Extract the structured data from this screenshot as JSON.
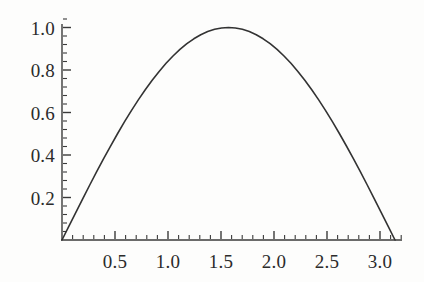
{
  "chart_data": {
    "type": "line",
    "title": "",
    "subtitle": "",
    "xlabel": "",
    "ylabel": "",
    "function": "sin(x)",
    "xlim": [
      0,
      3.2
    ],
    "ylim": [
      0,
      1.05
    ],
    "axis_origin": [
      0,
      0
    ],
    "grid": false,
    "legend": null,
    "legend_position": "none",
    "line_color": "#333333",
    "line_width": 1.6,
    "background_color": "#fdfdfc",
    "axis_color": "#3a3a3a",
    "x_tick_labels": [
      "0.5",
      "1.0",
      "1.5",
      "2.0",
      "2.5",
      "3.0"
    ],
    "x_tick_values": [
      0.5,
      1.0,
      1.5,
      2.0,
      2.5,
      3.0
    ],
    "x_minor_tick_step": 0.1,
    "y_tick_labels": [
      "0.2",
      "0.4",
      "0.6",
      "0.8",
      "1.0"
    ],
    "y_tick_values": [
      0.2,
      0.4,
      0.6,
      0.8,
      1.0
    ],
    "y_minor_tick_step": 0.04,
    "x": [
      0.0,
      0.0654,
      0.1309,
      0.1963,
      0.2618,
      0.3272,
      0.3927,
      0.4581,
      0.5236,
      0.589,
      0.6545,
      0.7199,
      0.7854,
      0.8508,
      0.9163,
      0.9817,
      1.0472,
      1.1126,
      1.1781,
      1.2435,
      1.309,
      1.3744,
      1.4399,
      1.5053,
      1.5708,
      1.6362,
      1.7017,
      1.7671,
      1.8326,
      1.898,
      1.9635,
      2.0289,
      2.0944,
      2.1598,
      2.2253,
      2.2907,
      2.3562,
      2.4216,
      2.4871,
      2.5525,
      2.618,
      2.6834,
      2.7489,
      2.8143,
      2.8798,
      2.9452,
      3.0107,
      3.0761,
      3.1416
    ],
    "y": [
      0.0,
      0.0654,
      0.1305,
      0.1951,
      0.2588,
      0.3214,
      0.3827,
      0.4423,
      0.5,
      0.5556,
      0.6088,
      0.6593,
      0.7071,
      0.7518,
      0.7934,
      0.8315,
      0.866,
      0.8969,
      0.9239,
      0.9469,
      0.9659,
      0.9808,
      0.9914,
      0.9979,
      1.0,
      0.9979,
      0.9914,
      0.9808,
      0.9659,
      0.9469,
      0.9239,
      0.8969,
      0.866,
      0.8315,
      0.7934,
      0.7518,
      0.7071,
      0.6593,
      0.6088,
      0.5556,
      0.5,
      0.4423,
      0.3827,
      0.3214,
      0.2588,
      0.1951,
      0.1305,
      0.0654,
      0.0
    ]
  }
}
